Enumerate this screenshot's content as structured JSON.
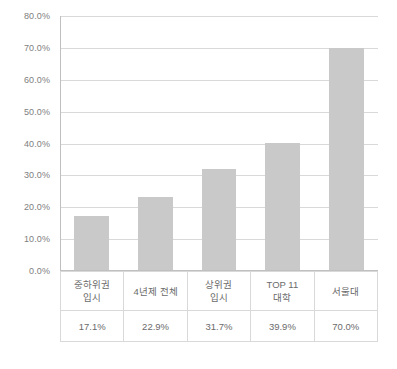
{
  "chart_data": {
    "type": "bar",
    "title": "",
    "subtitle": "",
    "xlabel": "",
    "ylabel": "",
    "categories": [
      "중하위권\n입시",
      "4년제 전체",
      "상위권\n입시",
      "TOP 11\n대학",
      "서울대"
    ],
    "values": [
      17.1,
      22.9,
      31.7,
      39.9,
      70.0
    ],
    "value_labels": [
      "17.1%",
      "22.9%",
      "31.7%",
      "39.9%",
      "70.0%"
    ],
    "ylim": [
      0,
      80
    ],
    "ytick_step": 10,
    "ytick_labels": [
      "0.0%",
      "10.0%",
      "20.0%",
      "30.0%",
      "40.0%",
      "50.0%",
      "60.0%",
      "70.0%",
      "80.0%"
    ],
    "ytick_values": [
      0,
      10,
      20,
      30,
      40,
      50,
      60,
      70,
      80
    ],
    "grid": true,
    "grid_axis": "y",
    "legend": false,
    "legend_position": "none",
    "data_table_visible": true,
    "series": [
      {
        "name": "",
        "values": [
          17.1,
          22.9,
          31.7,
          39.9,
          70.0
        ]
      }
    ]
  },
  "colors": {
    "bar_fill": "#c9c9c9",
    "gridline": "#d9d9d9",
    "axis_line": "#bfbfbf",
    "tick_text": "#808080",
    "table_text": "#6b6b6b",
    "table_border": "#d9d9d9",
    "background": "#ffffff"
  },
  "table": {
    "category_cells": [
      [
        "중하위권",
        "입시"
      ],
      [
        "4년제 전체"
      ],
      [
        "상위권",
        "입시"
      ],
      [
        "TOP 11",
        "대학"
      ],
      [
        "서울대"
      ]
    ],
    "value_cells": [
      "17.1%",
      "22.9%",
      "31.7%",
      "39.9%",
      "70.0%"
    ]
  }
}
